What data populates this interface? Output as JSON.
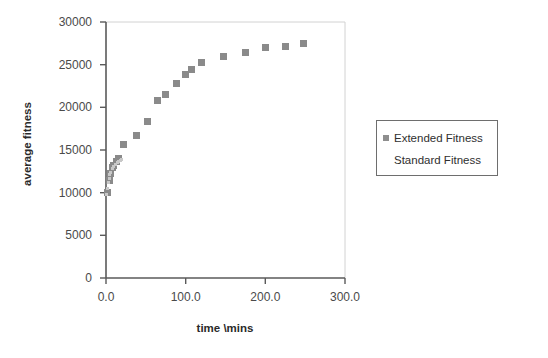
{
  "chart_data": {
    "type": "scatter",
    "title": "",
    "xlabel": "time \\mins",
    "ylabel": "average fitness",
    "xlim": [
      0,
      300
    ],
    "ylim": [
      0,
      30000
    ],
    "grid": false,
    "legend_position": "right",
    "x_ticks": [
      "0.0",
      "100.0",
      "200.0",
      "300.0"
    ],
    "x_tick_values": [
      0,
      100,
      200,
      300
    ],
    "y_ticks": [
      "0",
      "5000",
      "10000",
      "15000",
      "20000",
      "25000",
      "30000"
    ],
    "y_tick_values": [
      0,
      5000,
      10000,
      15000,
      20000,
      25000,
      30000
    ],
    "series": [
      {
        "name": "Extended Fitness",
        "color": "#8a8a8a",
        "marker": "square",
        "points": [
          [
            2,
            10000
          ],
          [
            4,
            11400
          ],
          [
            6,
            12300
          ],
          [
            8,
            12900
          ],
          [
            10,
            13200
          ],
          [
            13,
            13700
          ],
          [
            16,
            14000
          ],
          [
            22,
            15700
          ],
          [
            38,
            16700
          ],
          [
            52,
            18300
          ],
          [
            65,
            20800
          ],
          [
            75,
            21500
          ],
          [
            88,
            22800
          ],
          [
            100,
            23900
          ],
          [
            107,
            24400
          ],
          [
            120,
            25300
          ],
          [
            148,
            26000
          ],
          [
            175,
            26400
          ],
          [
            200,
            27000
          ],
          [
            225,
            27100
          ],
          [
            248,
            27500
          ]
        ]
      },
      {
        "name": "Standard Fitness",
        "color": "#c8c8c8",
        "marker": "none",
        "points": [
          [
            1,
            9800
          ],
          [
            2,
            10500
          ],
          [
            3,
            11200
          ],
          [
            4,
            11700
          ],
          [
            5,
            12100
          ],
          [
            6,
            12400
          ],
          [
            8,
            12800
          ],
          [
            10,
            13100
          ],
          [
            12,
            13300
          ],
          [
            14,
            13500
          ],
          [
            16,
            13700
          ],
          [
            18,
            13800
          ],
          [
            20,
            13900
          ]
        ]
      }
    ]
  },
  "legend": {
    "items": [
      {
        "label": "Extended Fitness",
        "swatch": "extended"
      },
      {
        "label": "Standard Fitness",
        "swatch": "standard"
      }
    ]
  },
  "axes": {
    "y_title": "average fitness",
    "x_title": "time \\mins"
  }
}
